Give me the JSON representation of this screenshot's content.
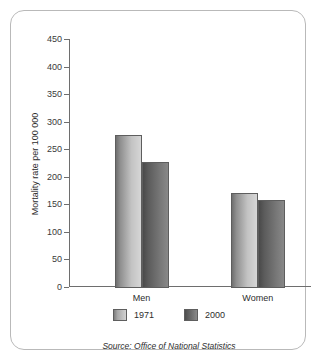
{
  "chart_data": {
    "type": "bar",
    "title": "",
    "subtitle": "",
    "categories": [
      "Men",
      "Women"
    ],
    "series": [
      {
        "name": "1971",
        "values": [
          277,
          173
        ],
        "color": "#b4b4b4"
      },
      {
        "name": "2000",
        "values": [
          228,
          159
        ],
        "color": "#6b6b6b"
      }
    ],
    "xlabel": "",
    "ylabel": "Mortality rate per 100 000",
    "ylim": [
      0,
      450
    ],
    "ytick_step": 50,
    "yticks": [
      0,
      50,
      100,
      150,
      200,
      250,
      300,
      350,
      400,
      450
    ],
    "ytick_labels": [
      "0",
      "50",
      "100",
      "150",
      "200",
      "250",
      "300",
      "350",
      "400",
      "450"
    ],
    "grid": false,
    "legend_position": "bottom",
    "legend_entries": [
      "1971",
      "2000"
    ],
    "annotations": [
      "Source: Office of National Statistics"
    ]
  },
  "axis": {
    "y_title": "Mortality rate per 100 000"
  },
  "legend": {
    "items": [
      {
        "label": "1971"
      },
      {
        "label": "2000"
      }
    ]
  },
  "source": {
    "text": "Source: Office of National Statistics"
  }
}
